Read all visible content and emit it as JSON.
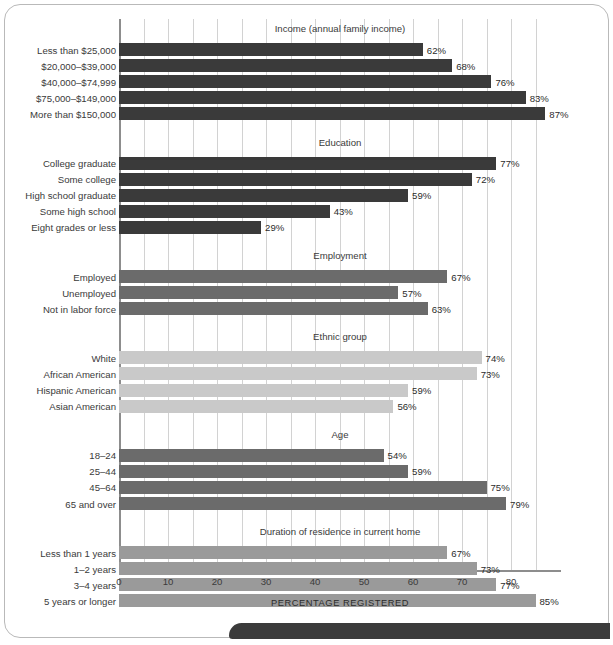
{
  "chart_data": {
    "type": "bar",
    "orientation": "horizontal",
    "title": "",
    "xlabel": "PERCENTAGE REGISTERED",
    "ylabel": "",
    "xlim": [
      0,
      87
    ],
    "xticks": [
      0,
      10,
      20,
      30,
      40,
      50,
      60,
      70,
      80
    ],
    "xtick_labels": [
      "0",
      "10",
      "20",
      "30",
      "40",
      "50",
      "60",
      "70",
      "80"
    ],
    "gridline_step": 5,
    "grid": true,
    "legend": "none",
    "value_suffix": "%",
    "groups": [
      {
        "name": "Income (annual family income)",
        "color": "#3a3a3a",
        "categories": [
          "Less than $25,000",
          "$20,000–$39,000",
          "$40,000–$74,999",
          "$75,000–$149,000",
          "More than $150,000"
        ],
        "values": [
          62,
          68,
          76,
          83,
          87
        ],
        "labels": [
          "62%",
          "68%",
          "76%",
          "83%",
          "87%"
        ]
      },
      {
        "name": "Education",
        "color": "#3a3a3a",
        "categories": [
          "College graduate",
          "Some college",
          "High school graduate",
          "Some high school",
          "Eight grades or less"
        ],
        "values": [
          77,
          72,
          59,
          43,
          29
        ],
        "labels": [
          "77%",
          "72%",
          "59%",
          "43%",
          "29%"
        ]
      },
      {
        "name": "Employment",
        "color": "#6b6b6b",
        "categories": [
          "Employed",
          "Unemployed",
          "Not in labor force"
        ],
        "values": [
          67,
          57,
          63
        ],
        "labels": [
          "67%",
          "57%",
          "63%"
        ]
      },
      {
        "name": "Ethnic group",
        "color": "#c9c9c9",
        "categories": [
          "White",
          "African American",
          "Hispanic American",
          "Asian American"
        ],
        "values": [
          74,
          73,
          59,
          56
        ],
        "labels": [
          "74%",
          "73%",
          "59%",
          "56%"
        ]
      },
      {
        "name": "Age",
        "color": "#6b6b6b",
        "categories": [
          "18–24",
          "25–44",
          "45–64",
          "65 and over"
        ],
        "values": [
          54,
          59,
          75,
          79
        ],
        "labels": [
          "54%",
          "59%",
          "75%",
          "79%"
        ]
      },
      {
        "name": "Duration of residence in current home",
        "color": "#9a9a9a",
        "categories": [
          "Less than 1 years",
          "1–2 years",
          "3–4 years",
          "5 years or longer"
        ],
        "values": [
          67,
          73,
          77,
          85
        ],
        "labels": [
          "67%",
          "73%",
          "77%",
          "85%"
        ]
      }
    ]
  }
}
